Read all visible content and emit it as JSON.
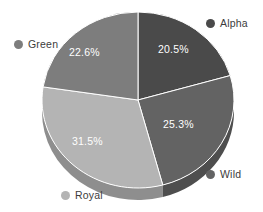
{
  "chart_data": {
    "type": "pie",
    "title": "",
    "legend_position": "corners",
    "three_d": true,
    "grid": false,
    "categories": [
      "Alpha",
      "Wild",
      "Royal",
      "Green"
    ],
    "values": [
      20.5,
      25.3,
      31.5,
      22.6
    ],
    "value_labels": [
      "20.5%",
      "25.3%",
      "31.5%",
      "22.6%"
    ],
    "colors": [
      "#4a4a4a",
      "#636363",
      "#b4b4b4",
      "#7d7d7d"
    ],
    "side_colors": [
      "#3a3a3a",
      "#4e4e4e",
      "#8e8e8e",
      "#626262"
    ],
    "background": "#ffffff",
    "slice_border_color": "#ffffff",
    "label_text_color": "#ffffff",
    "legend_text_color": "#3c3c3c"
  },
  "legend": {
    "items": [
      {
        "label": "Alpha",
        "color": "#4a4a4a"
      },
      {
        "label": "Green",
        "color": "#7d7d7d"
      },
      {
        "label": "Wild",
        "color": "#636363"
      },
      {
        "label": "Royal",
        "color": "#b4b4b4"
      }
    ]
  },
  "slice_labels": {
    "alpha": "20.5%",
    "green": "22.6%",
    "wild": "25.3%",
    "royal": "31.5%"
  }
}
